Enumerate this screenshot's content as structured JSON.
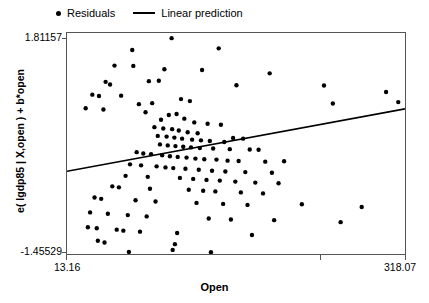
{
  "legend": {
    "entries": [
      {
        "label": "Residuals",
        "marker": "dot-marker-icon"
      },
      {
        "label": "Linear prediction",
        "marker": "line-marker-icon"
      }
    ]
  },
  "axes": {
    "x_title": "Open",
    "y_title": "e( lgdp85 | X,open ) + b*open",
    "x_tick_labels": [
      "13.16",
      "318.07"
    ],
    "y_tick_labels": [
      "1.81157",
      "-1.45529"
    ]
  },
  "chart_data": {
    "type": "scatter",
    "title": "",
    "xlabel": "Open",
    "ylabel": "e( lgdp85 | X,open ) + b*open",
    "xlim": [
      13.16,
      318.07
    ],
    "ylim": [
      -1.45529,
      1.81157
    ],
    "grid": false,
    "legend_position": "top-left-outside",
    "axis_color": "#555555",
    "marker_color": "#000000",
    "line_color": "#000000",
    "series": [
      {
        "name": "Residuals",
        "type": "scatter",
        "marker": "circle",
        "marker_size": 4.4,
        "points": [
          [
            107.5,
            1.735
          ],
          [
            72.0,
            1.56
          ],
          [
            150.0,
            1.585
          ],
          [
            56.0,
            1.33
          ],
          [
            73.0,
            1.325
          ],
          [
            101.0,
            1.275
          ],
          [
            135.0,
            1.265
          ],
          [
            196.0,
            1.215
          ],
          [
            48.0,
            1.09
          ],
          [
            52.0,
            1.05
          ],
          [
            87.0,
            1.1
          ],
          [
            96.0,
            1.105
          ],
          [
            166.0,
            1.04
          ],
          [
            245.0,
            1.035
          ],
          [
            301.0,
            0.94
          ],
          [
            36.0,
            0.9
          ],
          [
            42.0,
            0.88
          ],
          [
            62.0,
            0.885
          ],
          [
            78.0,
            0.76
          ],
          [
            90.0,
            0.775
          ],
          [
            116.0,
            0.835
          ],
          [
            124.0,
            0.805
          ],
          [
            253.0,
            0.77
          ],
          [
            312.0,
            0.79
          ],
          [
            30.0,
            0.7
          ],
          [
            46.0,
            0.68
          ],
          [
            84.0,
            0.64
          ],
          [
            105.0,
            0.6
          ],
          [
            112.0,
            0.615
          ],
          [
            98.0,
            0.53
          ],
          [
            119.0,
            0.545
          ],
          [
            128.0,
            0.49
          ],
          [
            140.0,
            0.47
          ],
          [
            152.0,
            0.455
          ],
          [
            92.0,
            0.42
          ],
          [
            100.0,
            0.4
          ],
          [
            108.0,
            0.39
          ],
          [
            114.0,
            0.37
          ],
          [
            122.0,
            0.345
          ],
          [
            131.0,
            0.33
          ],
          [
            95.0,
            0.29
          ],
          [
            103.0,
            0.28
          ],
          [
            110.0,
            0.265
          ],
          [
            117.0,
            0.25
          ],
          [
            126.0,
            0.235
          ],
          [
            134.0,
            0.225
          ],
          [
            142.0,
            0.215
          ],
          [
            155.0,
            0.2
          ],
          [
            163.0,
            0.26
          ],
          [
            172.0,
            0.25
          ],
          [
            97.0,
            0.165
          ],
          [
            104.0,
            0.15
          ],
          [
            111.0,
            0.14
          ],
          [
            118.0,
            0.13
          ],
          [
            125.0,
            0.12
          ],
          [
            133.0,
            0.11
          ],
          [
            145.0,
            0.105
          ],
          [
            160.0,
            0.095
          ],
          [
            178.0,
            0.09
          ],
          [
            186.0,
            0.085
          ],
          [
            76.0,
            0.05
          ],
          [
            82.0,
            0.03
          ],
          [
            89.0,
            0.02
          ],
          [
            99.0,
            0.005
          ],
          [
            106.0,
            -0.01
          ],
          [
            113.0,
            -0.02
          ],
          [
            121.0,
            -0.03
          ],
          [
            129.0,
            -0.045
          ],
          [
            137.0,
            -0.055
          ],
          [
            148.0,
            -0.06
          ],
          [
            158.0,
            -0.075
          ],
          [
            168.0,
            -0.08
          ],
          [
            192.0,
            -0.09
          ],
          [
            209.0,
            -0.085
          ],
          [
            70.0,
            -0.13
          ],
          [
            80.0,
            -0.145
          ],
          [
            94.0,
            -0.16
          ],
          [
            102.0,
            -0.175
          ],
          [
            109.0,
            -0.185
          ],
          [
            120.0,
            -0.195
          ],
          [
            132.0,
            -0.21
          ],
          [
            144.0,
            -0.225
          ],
          [
            156.0,
            -0.235
          ],
          [
            174.0,
            -0.245
          ],
          [
            198.0,
            -0.255
          ],
          [
            66.0,
            -0.3
          ],
          [
            86.0,
            -0.315
          ],
          [
            115.0,
            -0.33
          ],
          [
            127.0,
            -0.345
          ],
          [
            139.0,
            -0.36
          ],
          [
            151.0,
            -0.37
          ],
          [
            165.0,
            -0.385
          ],
          [
            183.0,
            -0.4
          ],
          [
            204.0,
            -0.41
          ],
          [
            54.0,
            -0.455
          ],
          [
            60.0,
            -0.47
          ],
          [
            88.0,
            -0.49
          ],
          [
            123.0,
            -0.505
          ],
          [
            136.0,
            -0.52
          ],
          [
            147.0,
            -0.53
          ],
          [
            170.0,
            -0.545
          ],
          [
            190.0,
            -0.56
          ],
          [
            38.0,
            -0.62
          ],
          [
            44.0,
            -0.64
          ],
          [
            75.0,
            -0.66
          ],
          [
            93.0,
            -0.68
          ],
          [
            130.0,
            -0.7
          ],
          [
            154.0,
            -0.715
          ],
          [
            176.0,
            -0.73
          ],
          [
            225.0,
            -0.72
          ],
          [
            279.0,
            -0.76
          ],
          [
            34.0,
            -0.84
          ],
          [
            50.0,
            -0.86
          ],
          [
            68.0,
            -0.88
          ],
          [
            85.0,
            -0.9
          ],
          [
            141.0,
            -0.93
          ],
          [
            161.0,
            -0.945
          ],
          [
            200.0,
            -0.955
          ],
          [
            260.0,
            -0.985
          ],
          [
            32.0,
            -1.06
          ],
          [
            40.0,
            -1.075
          ],
          [
            58.0,
            -1.095
          ],
          [
            64.0,
            -1.11
          ],
          [
            79.0,
            -1.125
          ],
          [
            112.5,
            -1.145
          ],
          [
            180.0,
            -1.175
          ],
          [
            41.0,
            -1.26
          ],
          [
            47.0,
            -1.285
          ],
          [
            110.5,
            -1.31
          ],
          [
            108.5,
            -1.395
          ],
          [
            69.0,
            -1.425
          ],
          [
            143.0,
            -1.43
          ]
        ]
      },
      {
        "name": "Linear prediction",
        "type": "line",
        "endpoints": [
          [
            13.16,
            -0.233
          ],
          [
            318.07,
            0.69
          ]
        ],
        "slope_per_unit": 0.003027,
        "intercept": -0.2728
      }
    ]
  }
}
